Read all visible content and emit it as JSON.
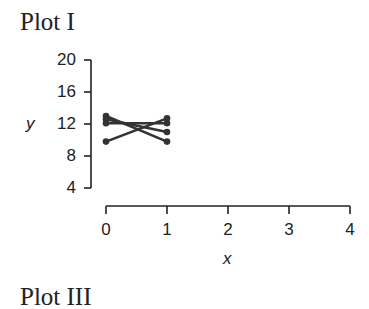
{
  "title": "Plot I",
  "next_title": "Plot III",
  "chart_data": {
    "type": "line",
    "title": "Plot I",
    "xlabel": "x",
    "ylabel": "y",
    "xlim": [
      0,
      4
    ],
    "ylim": [
      4,
      20
    ],
    "x_ticks": [
      0,
      1,
      2,
      3,
      4
    ],
    "y_ticks": [
      20,
      16,
      12,
      8,
      4
    ],
    "grid": false,
    "legend": null,
    "series": [
      {
        "name": "line1",
        "x": [
          0,
          1
        ],
        "y": [
          13.0,
          9.8
        ]
      },
      {
        "name": "line2",
        "x": [
          0,
          1
        ],
        "y": [
          12.6,
          11.0
        ]
      },
      {
        "name": "line3",
        "x": [
          0,
          1
        ],
        "y": [
          12.1,
          12.1
        ]
      },
      {
        "name": "line4",
        "x": [
          0,
          1
        ],
        "y": [
          9.8,
          12.7
        ]
      }
    ]
  }
}
